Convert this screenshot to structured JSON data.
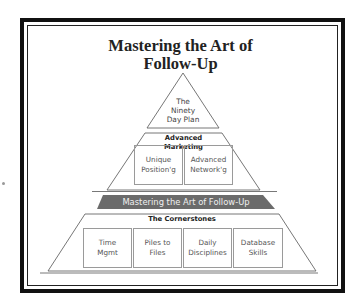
{
  "title": {
    "line1": "Mastering the Art of",
    "line2": "Follow-Up"
  },
  "pyramid": {
    "apex": {
      "lines": [
        "The",
        "Ninety",
        "Day Plan"
      ]
    },
    "middle_tier": {
      "header": "Advanced Marketing",
      "boxes": [
        {
          "label": "Unique\nPosition'g"
        },
        {
          "label": "Advanced\nNetwork'g"
        }
      ]
    },
    "band": {
      "label": "Mastering the Art of Follow-Up",
      "color": "#6b6b6b"
    },
    "base_tier": {
      "header": "The Cornerstones",
      "boxes": [
        {
          "label": "Time\nMgmt"
        },
        {
          "label": "Piles to\nFiles"
        },
        {
          "label": "Daily\nDisciplines"
        },
        {
          "label": "Database\nSkills"
        }
      ]
    }
  },
  "colors": {
    "frame": "#111111",
    "outline": "#777777",
    "band": "#6b6b6b"
  }
}
